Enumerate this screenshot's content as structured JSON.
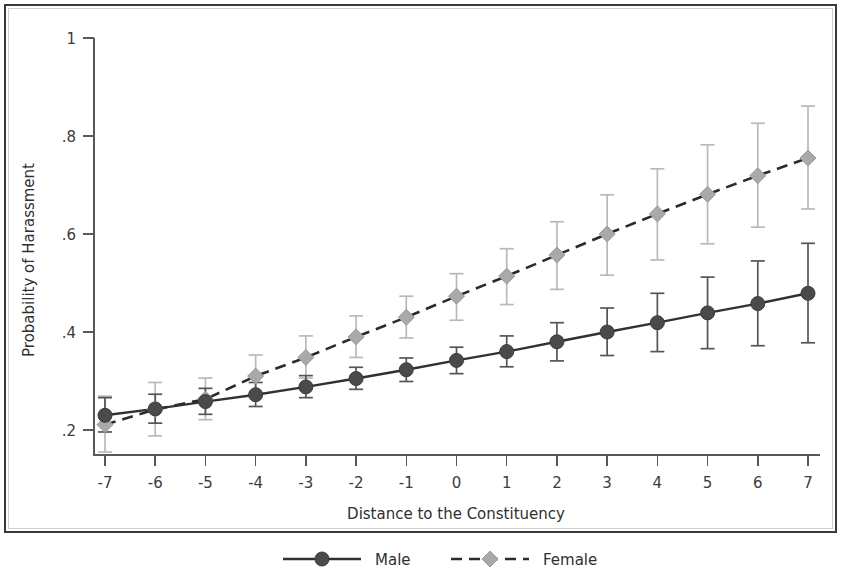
{
  "chart_data": {
    "type": "line",
    "title": "",
    "xlabel": "Distance to the Constituency",
    "ylabel": "Probability of Harassment",
    "x": [
      -7,
      -6,
      -5,
      -4,
      -3,
      -2,
      -1,
      0,
      1,
      2,
      3,
      4,
      5,
      6,
      7
    ],
    "xtick_labels": [
      "-7",
      "-6",
      "-5",
      "-4",
      "-3",
      "-2",
      "-1",
      "0",
      "1",
      "2",
      "3",
      "4",
      "5",
      "6",
      "7"
    ],
    "ytick_values": [
      0.2,
      0.4,
      0.6,
      0.8,
      1.0
    ],
    "ytick_labels": [
      ".2",
      ".4",
      ".6",
      ".8",
      "1"
    ],
    "xlim": [
      -7.6,
      7.6
    ],
    "ylim": [
      0.14,
      1.0
    ],
    "grid": false,
    "legend_position": "bottom",
    "error_bars": "95% confidence interval",
    "series": [
      {
        "name": "Male",
        "marker": "circle",
        "linestyle": "solid",
        "color": "#4a4a4c",
        "line_color": "#313131",
        "errorbar_color": "#555557",
        "values": [
          0.23,
          0.243,
          0.258,
          0.272,
          0.288,
          0.305,
          0.323,
          0.342,
          0.36,
          0.38,
          0.4,
          0.419,
          0.439,
          0.458,
          0.479
        ],
        "ci_low": [
          0.196,
          0.214,
          0.232,
          0.248,
          0.266,
          0.283,
          0.299,
          0.315,
          0.329,
          0.341,
          0.352,
          0.36,
          0.366,
          0.372,
          0.378
        ],
        "ci_high": [
          0.266,
          0.273,
          0.285,
          0.297,
          0.311,
          0.328,
          0.347,
          0.369,
          0.392,
          0.419,
          0.449,
          0.479,
          0.512,
          0.545,
          0.581
        ]
      },
      {
        "name": "Female",
        "marker": "diamond",
        "linestyle": "dashed",
        "color": "#a9a9a9",
        "line_color": "#2b2b2b",
        "errorbar_color": "#b9b9b9",
        "values": [
          0.211,
          0.242,
          0.263,
          0.31,
          0.348,
          0.39,
          0.43,
          0.473,
          0.514,
          0.557,
          0.6,
          0.641,
          0.681,
          0.719,
          0.755
        ],
        "ci_low": [
          0.155,
          0.188,
          0.221,
          0.268,
          0.306,
          0.348,
          0.388,
          0.424,
          0.456,
          0.487,
          0.516,
          0.547,
          0.58,
          0.614,
          0.651
        ],
        "ci_high": [
          0.269,
          0.297,
          0.306,
          0.353,
          0.392,
          0.433,
          0.473,
          0.519,
          0.57,
          0.625,
          0.68,
          0.733,
          0.782,
          0.826,
          0.861
        ]
      }
    ],
    "legend": [
      {
        "label": "Male",
        "marker": "circle",
        "linestyle": "solid"
      },
      {
        "label": "Female",
        "marker": "diamond",
        "linestyle": "dashed"
      }
    ]
  }
}
